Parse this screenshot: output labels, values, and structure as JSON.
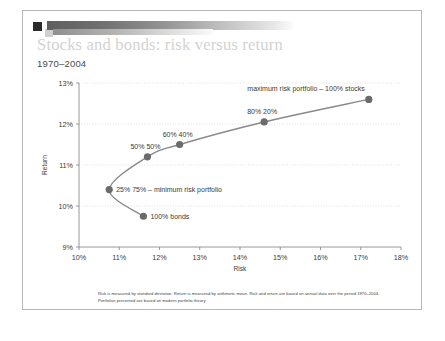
{
  "slide": {
    "title": "Stocks and bonds: risk versus return",
    "subtitle": "1970–2004",
    "footnote": "Risk is measured by standard deviation. Return is measured by arithmetic mean. Risk and return are based on annual data over the period 1970–2004. Portfolios presented are based on modern portfolio theory.",
    "logo_icon": "square-logo-icon"
  },
  "colors": {
    "marker": "#6b6b6b",
    "curve": "#8a8a8a",
    "axis": "#8c8c8c",
    "gridline": "#c9c9c9",
    "label_text": "#3a3a3a",
    "title_text": "#d2d2d2",
    "border": "#b9b9b9"
  },
  "chart_data": {
    "type": "line",
    "title": "Stocks and bonds: risk versus return",
    "subtitle": "1970–2004",
    "xlabel": "Risk",
    "ylabel": "Return",
    "xlim": [
      10,
      18
    ],
    "ylim": [
      9,
      13
    ],
    "xticks": [
      10,
      11,
      12,
      13,
      14,
      15,
      16,
      17,
      18
    ],
    "xticklabels": [
      "10%",
      "11%",
      "12%",
      "13%",
      "14%",
      "15%",
      "16%",
      "17%",
      "18%"
    ],
    "yticks": [
      9,
      10,
      11,
      12,
      13
    ],
    "yticklabels": [
      "9%",
      "10%",
      "11%",
      "12%",
      "13%"
    ],
    "grid": "horizontal-dotted",
    "legend": "none",
    "series": [
      {
        "name": "Efficient frontier",
        "x": [
          11.6,
          10.75,
          11.7,
          12.5,
          14.6,
          17.2
        ],
        "y": [
          9.75,
          10.4,
          11.2,
          11.5,
          12.05,
          12.6
        ]
      }
    ],
    "points": [
      {
        "label": "100% bonds",
        "x": 11.6,
        "y": 9.75,
        "label_pos": "right"
      },
      {
        "label": "25% 75% – minimum risk portfolio",
        "x": 10.75,
        "y": 10.4,
        "label_pos": "right"
      },
      {
        "label": "50% 50%",
        "x": 11.7,
        "y": 11.2,
        "label_pos": "above"
      },
      {
        "label": "60% 40%",
        "x": 12.5,
        "y": 11.5,
        "label_pos": "above"
      },
      {
        "label": "80% 20%",
        "x": 14.6,
        "y": 12.05,
        "label_pos": "above"
      },
      {
        "label": "maximum risk portfolio – 100% stocks",
        "x": 17.2,
        "y": 12.6,
        "label_pos": "above-left"
      }
    ],
    "annotations": [
      "maximum risk portfolio – 100% stocks",
      "80% 20%",
      "60% 40%",
      "50% 50%",
      "25% 75% – minimum risk portfolio",
      "100% bonds"
    ]
  }
}
